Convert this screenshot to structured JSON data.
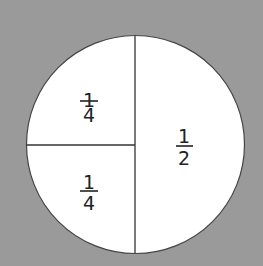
{
  "diagram": {
    "title": "",
    "background_color": "#9a9a9a",
    "circle_fill": "#ffffff",
    "line_color": "#333333",
    "sections": [
      {
        "id": "top-left",
        "numerator": "1",
        "denominator": "4"
      },
      {
        "id": "bottom-left",
        "numerator": "1",
        "denominator": "4"
      },
      {
        "id": "right",
        "numerator": "1",
        "denominator": "2"
      }
    ]
  }
}
